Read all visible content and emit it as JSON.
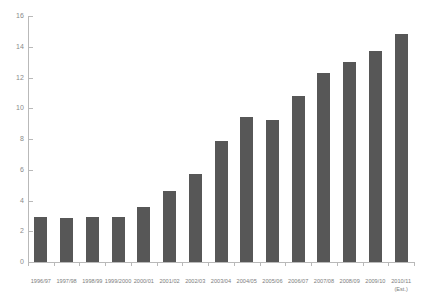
{
  "chart_data": {
    "type": "bar",
    "title": "",
    "subtitle": "",
    "xlabel": "",
    "ylabel": "",
    "ylim": [
      0,
      16
    ],
    "ytick_step": 2,
    "yticks": [
      0,
      2,
      4,
      6,
      8,
      10,
      12,
      14,
      16
    ],
    "ytick_labels": [
      "0",
      "2",
      "4",
      "6",
      "8",
      "10",
      "12",
      "14",
      "16"
    ],
    "grid": false,
    "legend": null,
    "bar_color": "#575757",
    "axis_color": "#b9b9b9",
    "tick_label_color": "#8a8a8a",
    "categories": [
      "1996/97",
      "1997/98",
      "1998/99",
      "1999/2000",
      "2000/01",
      "2001/02",
      "2002/03",
      "2003/04",
      "2004/05",
      "2005/06",
      "2006/07",
      "2007/08",
      "2008/09",
      "2009/10",
      "2010/11\n(Est.)"
    ],
    "values": [
      2.9,
      2.85,
      2.9,
      2.95,
      3.6,
      4.6,
      5.75,
      7.9,
      9.4,
      9.25,
      10.8,
      12.3,
      13.0,
      13.7,
      14.8
    ]
  }
}
